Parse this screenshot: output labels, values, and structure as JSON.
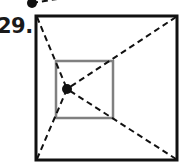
{
  "problem": {
    "number_label": "29."
  },
  "figure": {
    "outer_square": {
      "x1": 36,
      "y1": 16,
      "x2": 177,
      "y2": 160,
      "stroke": "#111111",
      "stroke_width": 3
    },
    "inner_square": {
      "x1": 56,
      "y1": 61,
      "x2": 113,
      "y2": 118,
      "stroke": "#808080",
      "stroke_width": 2.5
    },
    "point": {
      "cx": 67,
      "cy": 89,
      "r": 5,
      "fill": "#111111"
    },
    "dashed_lines": [
      {
        "from": "outer-top-left",
        "x1": 37,
        "y1": 17,
        "x2": 67,
        "y2": 89
      },
      {
        "from": "outer-top-right",
        "x1": 176,
        "y1": 17,
        "x2": 67,
        "y2": 89
      },
      {
        "from": "outer-bottom-right",
        "x1": 176,
        "y1": 159,
        "x2": 67,
        "y2": 89
      },
      {
        "from": "outer-bottom-left",
        "x1": 37,
        "y1": 159,
        "x2": 67,
        "y2": 89
      }
    ],
    "dash_pattern": "6 4",
    "partial_previous_figure": {
      "point": {
        "cx": 32,
        "cy": 3,
        "r": 5
      },
      "dashed_segment": {
        "x1": 32,
        "y1": 3,
        "x2": 70,
        "y2": -3
      }
    }
  }
}
